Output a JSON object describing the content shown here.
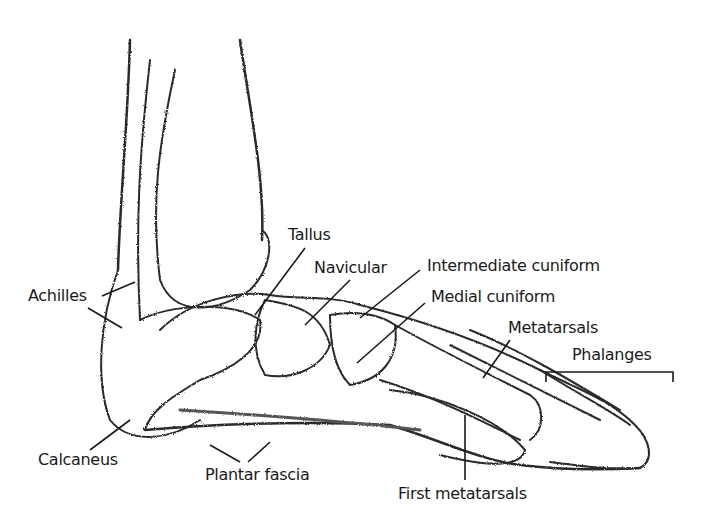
{
  "diagram": {
    "labels": {
      "tallus": "Tallus",
      "navicular": "Navicular",
      "intermediate_cuniform": "Intermediate cuniform",
      "medial_cuniform": "Medial cuniform",
      "metatarsals": "Metatarsals",
      "phalanges": "Phalanges",
      "achilles": "Achilles",
      "calcaneus": "Calcaneus",
      "plantar_fascia": "Plantar fascia",
      "first_metatarsals": "First metatarsals"
    },
    "colors": {
      "ink": "#1a1a1a",
      "shade": "#9a9a9a",
      "background": "#ffffff"
    }
  }
}
